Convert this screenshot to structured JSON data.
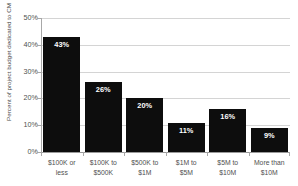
{
  "chart_data": {
    "type": "bar",
    "title": "",
    "subtitle": "",
    "xlabel": "",
    "ylabel": "Percent of project budget dedicated to CM",
    "categories": [
      "$100K or less",
      "$100K to $500K",
      "$500K to $1M",
      "$1M to $5M",
      "$5M to $10M",
      "More than $10M"
    ],
    "category_lines": [
      [
        "$100K or",
        "less"
      ],
      [
        "$100K to",
        "$500K"
      ],
      [
        "$500K to",
        "$1M"
      ],
      [
        "$1M to",
        "$5M"
      ],
      [
        "$5M to",
        "$10M"
      ],
      [
        "More than",
        "$10M"
      ]
    ],
    "values": [
      43,
      26,
      20,
      11,
      16,
      9
    ],
    "value_labels": [
      "43%",
      "26%",
      "20%",
      "11%",
      "16%",
      "9%"
    ],
    "ylim": [
      0,
      50
    ],
    "ytick_values": [
      50,
      40,
      30,
      20,
      10,
      0
    ],
    "ytick_labels": [
      "50%",
      "40%",
      "30%",
      "20%",
      "10%",
      "0%"
    ],
    "grid": true,
    "legend": false,
    "legend_position": "none",
    "colors": {
      "bar": "#0d0d0d",
      "value_label": "#ffffff",
      "gridline": "#d4d4d4",
      "axis": "#a8a8a8",
      "tick_text": "#4f4f4f",
      "axis_title": "#4a4a4a",
      "background": "#ffffff"
    }
  }
}
